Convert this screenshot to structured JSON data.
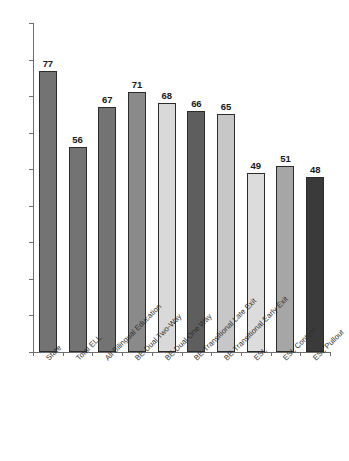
{
  "chart_data": {
    "type": "bar",
    "title": "",
    "subtitle": "",
    "xlabel": "",
    "ylabel": "",
    "ylim": [
      0,
      90
    ],
    "ytick_step": 10,
    "yticks": [
      0,
      10,
      20,
      30,
      40,
      50,
      60,
      70,
      80,
      90
    ],
    "grid": false,
    "legend": null,
    "categories": [
      "State",
      "Total ELL",
      "All Bilingual Education",
      "BE-Dual Two-Way",
      "BE-Dual One Way",
      "BE-Transitional Late Exit",
      "BE-Transitional Early Exit",
      "ESL",
      "ESL Content",
      "ESL Pullout"
    ],
    "values": [
      77,
      56,
      67,
      71,
      68,
      66,
      65,
      49,
      51,
      48
    ],
    "bar_colors": [
      "#737373",
      "#737373",
      "#737373",
      "#8a8a8a",
      "#d9d9d9",
      "#5e5e5e",
      "#c7c7c7",
      "#dcdcdc",
      "#a6a6a6",
      "#3a3a3a"
    ],
    "bar_outline": "#2b2b2b",
    "axis_color": "#6e6e6e",
    "label_color": "#2e2e2e",
    "value_label_color": "#1a1a1a",
    "background": "#ffffff"
  }
}
